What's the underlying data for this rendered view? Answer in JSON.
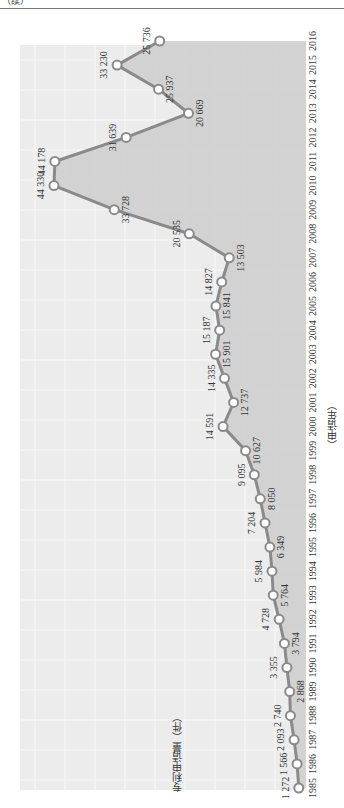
{
  "header": {
    "text": "（续）"
  },
  "chart_data": {
    "type": "area",
    "orientation": "rotated-90",
    "title": "",
    "xlabel": "（申请年）",
    "ylabel": "专利申请量（件）",
    "categories": [
      "1985",
      "1986",
      "1987",
      "1988",
      "1989",
      "1990",
      "1991",
      "1992",
      "1993",
      "1994",
      "1995",
      "1996",
      "1997",
      "1998",
      "1999",
      "2000",
      "2001",
      "2002",
      "2003",
      "2004",
      "2005",
      "2006",
      "2007",
      "2008",
      "2009",
      "2010",
      "2011",
      "2012",
      "2013",
      "2014",
      "2015",
      "2016"
    ],
    "series": [
      {
        "name": "专利申请量",
        "values": [
          1272,
          1566,
          2093,
          2740,
          2868,
          3355,
          3794,
          4728,
          5764,
          5984,
          6349,
          7204,
          8050,
          9095,
          10627,
          14591,
          12737,
          14335,
          15901,
          15187,
          15841,
          14827,
          13503,
          20535,
          33728,
          44330,
          44178,
          31639,
          20669,
          25937,
          33230,
          25736
        ]
      }
    ],
    "data_labels": [
      "1 272",
      "1 566",
      "2 093",
      "2 740",
      "2 868",
      "3 355",
      "3 794",
      "4 728",
      "5 764",
      "5 984",
      "6 349",
      "7 204",
      "8 050",
      "9 095",
      "10 627",
      "14 591",
      "12 737",
      "14 335",
      "15 901",
      "15 187",
      "15 841",
      "14 827",
      "13 503",
      "20 535",
      "33 728",
      "44 330",
      "44 178",
      "31 639",
      "20 669",
      "25 937",
      "33 230",
      "25 736"
    ],
    "grid": true,
    "legend": false,
    "colors": {
      "line": "#8a8a8a",
      "fill": "#cfcfcf",
      "plot_bg": "#ececec",
      "marker_fill": "#ffffff"
    }
  }
}
